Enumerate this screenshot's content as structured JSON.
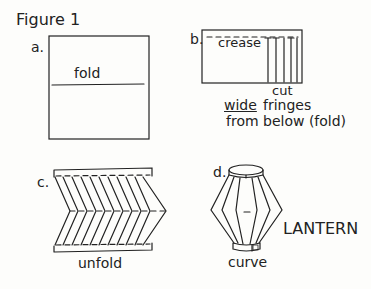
{
  "figure": {
    "title": "Figure 1",
    "panels": {
      "a": {
        "letter": "a.",
        "fold_label": "fold"
      },
      "b": {
        "letter": "b.",
        "crease_label": "crease",
        "cut_label": "cut",
        "wide_label": "wide",
        "fringes_label": "fringes",
        "from_below_label": "from below (fold)"
      },
      "c": {
        "letter": "c.",
        "unfold_label": "unfold"
      },
      "d": {
        "letter": "d.",
        "curve_label": "curve",
        "lantern_label": "LANTERN"
      }
    }
  }
}
